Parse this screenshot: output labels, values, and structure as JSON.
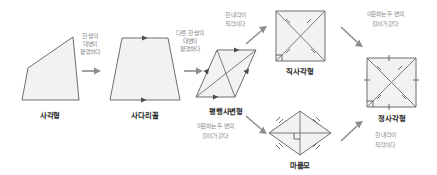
{
  "diagram": {
    "title_visible": false,
    "background": "#ffffff",
    "shape_fill": "#f2f2f2",
    "shape_stroke": "#6e6e6e",
    "annotation_color": "#8a8a8a",
    "caption_color": "#2b2b2b",
    "arrow_color": "#8d8d8d"
  },
  "shapes": [
    {
      "id": "quadrilateral",
      "caption": "사각형",
      "marks": "none"
    },
    {
      "id": "trapezoid",
      "caption": "사다리꼴",
      "marks": "one-pair-parallel"
    },
    {
      "id": "parallelogram",
      "caption": "평행사변형",
      "marks": "two-pairs-parallel-with-diagonals"
    },
    {
      "id": "rectangle",
      "caption": "직사각형",
      "marks": "equal-diagonals-right-angle"
    },
    {
      "id": "rhombus",
      "caption": "마름모",
      "marks": "equal-sides-perpendicular-diagonals"
    },
    {
      "id": "square",
      "caption": "정사각형",
      "marks": "equal-sides-equal-perpendicular-diagonals"
    }
  ],
  "transitions": [
    {
      "id": "quad-to-trapezoid",
      "from": "사각형",
      "to": "사다리꼴",
      "line1": "한 쌍의",
      "line2": "대변이",
      "line3": "평행하다"
    },
    {
      "id": "trapezoid-to-parallelogram",
      "from": "사다리꼴",
      "to": "평행사변형",
      "line1": "다른 한 쌍의",
      "line2": "대변이",
      "line3": "평행하다"
    },
    {
      "id": "parallelogram-to-rectangle",
      "from": "평행사변형",
      "to": "직사각형",
      "line1": "한 내각이",
      "line2": "직각이다",
      "line3": ""
    },
    {
      "id": "parallelogram-to-rhombus",
      "from": "평행사변형",
      "to": "마름모",
      "line1": "이웃하는 두 변의",
      "line2": "길이가 같다",
      "line3": ""
    },
    {
      "id": "rectangle-to-square",
      "from": "직사각형",
      "to": "정사각형",
      "line1": "이웃하는 두 변의",
      "line2": "길이가 같다",
      "line3": ""
    },
    {
      "id": "rhombus-to-square",
      "from": "마름모",
      "to": "정사각형",
      "line1": "한 내각이",
      "line2": "직각이다",
      "line3": ""
    }
  ]
}
